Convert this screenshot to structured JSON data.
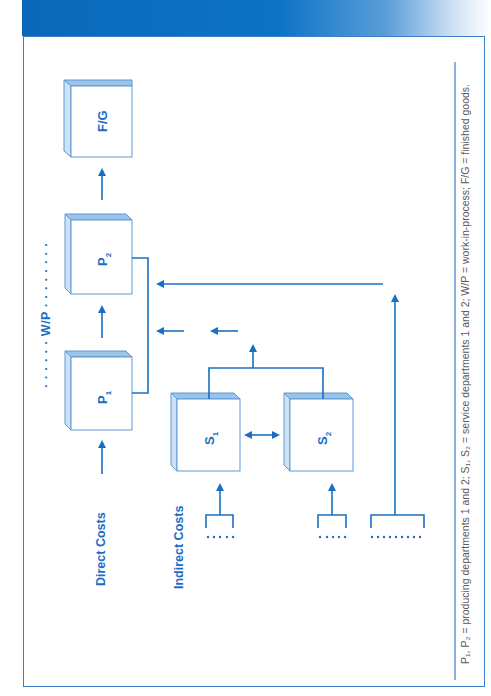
{
  "header": {
    "gradient_colors": [
      "#0b68b8",
      "#ffffff"
    ]
  },
  "diagram": {
    "accent_color": "#1a6fc4",
    "boxes": [
      {
        "id": "F/G",
        "label": "F/G"
      },
      {
        "id": "P2",
        "label": "P",
        "sub": "2"
      },
      {
        "id": "P1",
        "label": "P",
        "sub": "1"
      },
      {
        "id": "S1",
        "label": "S",
        "sub": "1"
      },
      {
        "id": "S2",
        "label": "S",
        "sub": "2"
      }
    ],
    "labels": {
      "wip": "W/P",
      "wip_dots_left": "· · · · · ·",
      "wip_dots_right": "· · · · · · · ·",
      "direct_costs": "Direct Costs",
      "indirect_costs": "Indirect Costs"
    },
    "caption": "P₁, P₂ = producing departments 1 and 2; S₁, S₂ = service departments 1 and 2; W/P = work-in-process; F/G = finished goods.",
    "edges": [
      {
        "from": "Direct Costs",
        "to": "P1"
      },
      {
        "from": "P1",
        "to": "P2"
      },
      {
        "from": "P2",
        "to": "F/G"
      },
      {
        "from": "Indirect Costs (S1 pool)",
        "to": "S1"
      },
      {
        "from": "Indirect Costs (S2 pool)",
        "to": "S2"
      },
      {
        "from": "S1",
        "to": "S2",
        "bidirectional": true
      },
      {
        "from": "S1+S2",
        "to": "P1/P2"
      },
      {
        "from": "Indirect Costs (shared pool)",
        "to": "P1/P2"
      }
    ]
  }
}
